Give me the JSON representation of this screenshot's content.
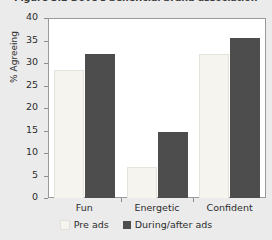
{
  "chart_data": {
    "type": "bar",
    "title": "Figure 3.2  Dove's beneficial brand association",
    "xlabel": "",
    "ylabel": "% Agreeing",
    "categories": [
      "Fun",
      "Energetic",
      "Confident"
    ],
    "series": [
      {
        "name": "Pre ads",
        "color": "#f6f4ef",
        "values": [
          28.5,
          7.0,
          32.0
        ]
      },
      {
        "name": "During/after ads",
        "color": "#4d4d4d",
        "values": [
          32.0,
          14.7,
          35.5
        ]
      }
    ],
    "ylim": [
      0,
      40
    ],
    "yticks": [
      0,
      5,
      10,
      15,
      20,
      25,
      30,
      35,
      40
    ],
    "ytick_labels": [
      "0",
      "5",
      "10",
      "15",
      "20",
      "25",
      "30",
      "35",
      "40"
    ],
    "grid": false,
    "legend_position": "bottom",
    "legend": [
      "Pre ads",
      "During/after ads"
    ],
    "plot_background": "#ffffff",
    "figure_background": "#ebebeb"
  }
}
